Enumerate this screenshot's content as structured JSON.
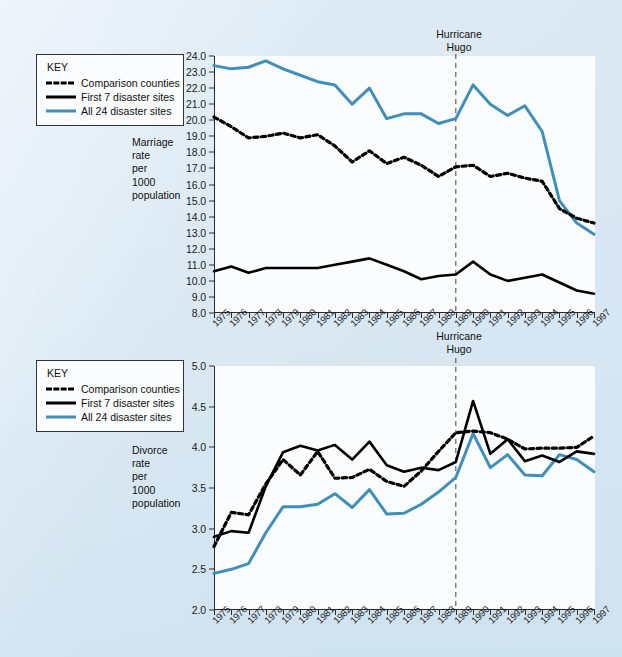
{
  "background_color": "#d9e8f3",
  "series_colors": {
    "comparison_counties": "#000000",
    "first_7_disaster_sites": "#000000",
    "all_24_disaster_sites": "#3f8fba"
  },
  "legend": {
    "title": "KEY",
    "entries": [
      {
        "label": "Comparison counties",
        "style": "dashed",
        "color": "#000000",
        "icon": "dashed-line-icon"
      },
      {
        "label": "First 7 disaster sites",
        "style": "solid",
        "color": "#000000",
        "icon": "solid-line-icon"
      },
      {
        "label": "All 24 disaster sites",
        "style": "solid",
        "color": "#3f8fba",
        "icon": "blue-line-icon"
      }
    ]
  },
  "ghost_text": "behind the chart faint show-through of printed page text",
  "chart_data": [
    {
      "id": "marriage",
      "type": "line",
      "title": "",
      "xlabel": "",
      "ylabel": "Marriage\nrate\nper\n1000\npopulation",
      "ylabel_lines": [
        "Marriage",
        "rate",
        "per",
        "1000",
        "population"
      ],
      "ylim": [
        8.0,
        24.0
      ],
      "yticks": [
        "8.0",
        "9.0",
        "10.0",
        "11.0",
        "12.0",
        "13.0",
        "14.0",
        "15.0",
        "16.0",
        "17.0",
        "18.0",
        "19.0",
        "20.0",
        "21.0",
        "22.0",
        "23.0",
        "24.0"
      ],
      "ytick_values": [
        8,
        9,
        10,
        11,
        12,
        13,
        14,
        15,
        16,
        17,
        18,
        19,
        20,
        21,
        22,
        23,
        24
      ],
      "grid": false,
      "legend_position": "outside-left-top",
      "x": [
        1975,
        1976,
        1977,
        1978,
        1979,
        1980,
        1981,
        1982,
        1983,
        1984,
        1985,
        1986,
        1987,
        1988,
        1989,
        1990,
        1991,
        1992,
        1993,
        1994,
        1995,
        1996,
        1997
      ],
      "categories": [
        "1975",
        "1976",
        "1977",
        "1978",
        "1979",
        "1980",
        "1981",
        "1982",
        "1983",
        "1984",
        "1985",
        "1986",
        "1987",
        "1988",
        "1989",
        "1990",
        "1991",
        "1992",
        "1993",
        "1994",
        "1995",
        "1996",
        "1997"
      ],
      "annotations": [
        {
          "text": "Hurricane\nHugo",
          "text_lines": [
            "Hurricane",
            "Hugo"
          ],
          "at_x": 1989,
          "style": "dashed-vertical-line"
        }
      ],
      "series": [
        {
          "name": "Comparison counties",
          "style": "dashed",
          "color": "#000000",
          "values": [
            20.2,
            19.6,
            18.9,
            19.0,
            19.2,
            18.9,
            19.1,
            18.4,
            17.4,
            18.1,
            17.3,
            17.7,
            17.2,
            16.5,
            17.1,
            17.2,
            16.5,
            16.7,
            16.4,
            16.2,
            14.5,
            13.9,
            13.6
          ]
        },
        {
          "name": "First 7 disaster sites",
          "style": "solid",
          "color": "#000000",
          "values": [
            10.6,
            10.9,
            10.5,
            10.8,
            10.8,
            10.8,
            10.8,
            11.0,
            11.2,
            11.4,
            11.0,
            10.6,
            10.1,
            10.3,
            10.4,
            11.2,
            10.4,
            10.0,
            10.2,
            10.4,
            9.9,
            9.4,
            9.2
          ]
        },
        {
          "name": "All 24 disaster sites",
          "style": "solid",
          "color": "#3f8fba",
          "values": [
            23.4,
            23.2,
            23.3,
            23.7,
            23.2,
            22.8,
            22.4,
            22.2,
            21.0,
            22.0,
            20.1,
            20.4,
            20.4,
            19.8,
            20.1,
            22.2,
            21.0,
            20.3,
            20.9,
            19.3,
            15.0,
            13.6,
            12.9
          ]
        }
      ]
    },
    {
      "id": "divorce",
      "type": "line",
      "title": "",
      "xlabel": "",
      "ylabel": "Divorce\nrate\nper\n1000\npopulation",
      "ylabel_lines": [
        "Divorce",
        "rate",
        "per",
        "1000",
        "population"
      ],
      "ylim": [
        2.0,
        5.0
      ],
      "yticks": [
        "2.0",
        "2.5",
        "3.0",
        "3.5",
        "4.0",
        "4.5",
        "5.0"
      ],
      "ytick_values": [
        2.0,
        2.5,
        3.0,
        3.5,
        4.0,
        4.5,
        5.0
      ],
      "grid": false,
      "legend_position": "outside-left-top",
      "x": [
        1975,
        1976,
        1977,
        1978,
        1979,
        1980,
        1981,
        1982,
        1983,
        1984,
        1985,
        1986,
        1987,
        1988,
        1989,
        1990,
        1991,
        1992,
        1993,
        1994,
        1995,
        1996,
        1997
      ],
      "categories": [
        "1975",
        "1976",
        "1977",
        "1978",
        "1979",
        "1980",
        "1981",
        "1982",
        "1983",
        "1984",
        "1985",
        "1986",
        "1987",
        "1988",
        "1989",
        "1990",
        "1991",
        "1992",
        "1993",
        "1994",
        "1995",
        "1996",
        "1997"
      ],
      "annotations": [
        {
          "text": "Hurricane\nHugo",
          "text_lines": [
            "Hurricane",
            "Hugo"
          ],
          "at_x": 1989,
          "style": "dashed-vertical-line"
        }
      ],
      "series": [
        {
          "name": "Comparison counties",
          "style": "dashed",
          "color": "#000000",
          "values": [
            2.78,
            3.2,
            3.17,
            3.55,
            3.85,
            3.66,
            3.95,
            3.62,
            3.63,
            3.73,
            3.58,
            3.52,
            3.71,
            3.95,
            4.18,
            4.2,
            4.18,
            4.1,
            3.98,
            3.99,
            3.99,
            4.0,
            4.14
          ]
        },
        {
          "name": "First 7 disaster sites",
          "style": "solid",
          "color": "#000000",
          "values": [
            2.9,
            2.97,
            2.95,
            3.52,
            3.94,
            4.02,
            3.96,
            4.03,
            3.85,
            4.07,
            3.78,
            3.7,
            3.75,
            3.72,
            3.82,
            4.57,
            3.92,
            4.1,
            3.83,
            3.9,
            3.82,
            3.95,
            3.92
          ]
        },
        {
          "name": "All 24 disaster sites",
          "style": "solid",
          "color": "#3f8fba",
          "values": [
            2.45,
            2.5,
            2.57,
            2.95,
            3.27,
            3.27,
            3.3,
            3.43,
            3.26,
            3.48,
            3.18,
            3.19,
            3.3,
            3.45,
            3.63,
            4.17,
            3.75,
            3.91,
            3.66,
            3.65,
            3.91,
            3.85,
            3.7
          ]
        }
      ]
    }
  ]
}
